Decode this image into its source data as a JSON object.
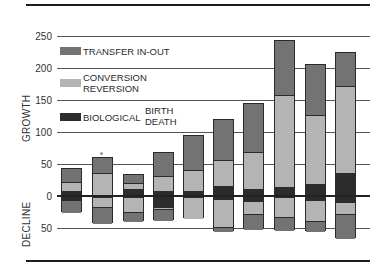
{
  "colors": {
    "transfer": "#737373",
    "conversion": "#b4b4b4",
    "biological": "#2c2c2c",
    "border": "#2b2b2b"
  },
  "axis": {
    "growth_label": "GROWTH",
    "decline_label": "DECLINE",
    "ticks": [
      "250",
      "200",
      "150",
      "100",
      "50",
      "0",
      "50"
    ]
  },
  "legend": {
    "transfer": "TRANSFER IN-OUT",
    "conversion_1": "CONVERSION",
    "conversion_2": "REVERSION",
    "biological": "BIOLOGICAL",
    "birth": "BIRTH",
    "death": "DEATH"
  },
  "annotation": "*",
  "chart_data": {
    "type": "bar",
    "subtype": "stacked diverging bar",
    "title": "",
    "xlabel": "",
    "ylabel": "GROWTH (up) / DECLINE (down)",
    "ylim": [
      -50,
      250
    ],
    "y_ticks": [
      250,
      200,
      150,
      100,
      50,
      0,
      -50
    ],
    "grid": true,
    "legend_position": "upper-left inside plot",
    "categories": [
      "1",
      "2",
      "3",
      "4",
      "5",
      "6",
      "7",
      "8",
      "9",
      "10"
    ],
    "series": [
      {
        "name": "TRANSFER IN-OUT (growth)",
        "values": [
          20,
          24,
          13,
          36,
          54,
          63,
          75,
          84,
          79,
          52
        ]
      },
      {
        "name": "CONVERSION REVERSION (growth)",
        "values": [
          14,
          37,
          10,
          23,
          32,
          41,
          58,
          145,
          108,
          135
        ]
      },
      {
        "name": "BIOLOGICAL BIRTH DEATH (growth)",
        "values": [
          10,
          0,
          12,
          10,
          10,
          17,
          12,
          15,
          20,
          38
        ]
      },
      {
        "name": "BIOLOGICAL BIRTH DEATH (decline)",
        "values": [
          -5,
          0,
          0,
          -15,
          0,
          -3,
          -7,
          0,
          -5,
          -8
        ]
      },
      {
        "name": "CONVERSION REVERSION (decline)",
        "values": [
          0,
          -16,
          -24,
          -4,
          -34,
          -44,
          -20,
          -32,
          -32,
          -18
        ]
      },
      {
        "name": "TRANSFER IN-OUT (decline)",
        "values": [
          -20,
          -26,
          -15,
          -18,
          0,
          -8,
          -24,
          -21,
          -18,
          -39
        ]
      }
    ],
    "totals_growth": [
      44,
      61,
      35,
      69,
      96,
      121,
      145,
      244,
      207,
      225
    ],
    "totals_decline": [
      -25,
      -42,
      -39,
      -37,
      -34,
      -55,
      -51,
      -53,
      -55,
      -65
    ],
    "annotations": [
      "* above bar 2"
    ]
  }
}
